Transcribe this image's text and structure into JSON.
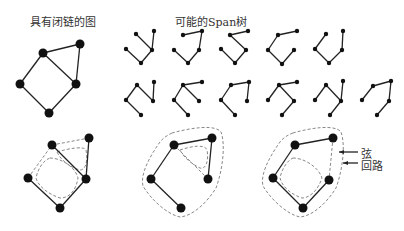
{
  "titles": {
    "graph": "具有闭链的图",
    "spanning_trees": "可能的Span树"
  },
  "annotations": {
    "chord": "弦",
    "loop": "回路"
  },
  "colors": {
    "edge": "#222222",
    "node": "#111111",
    "dashed": "#888888"
  },
  "main_graph": {
    "nodes": [
      [
        43,
        53
      ],
      [
        80,
        44
      ],
      [
        76,
        84
      ],
      [
        20,
        84
      ],
      [
        49,
        113
      ]
    ],
    "edges": [
      [
        0,
        1
      ],
      [
        1,
        2
      ],
      [
        0,
        2
      ],
      [
        2,
        4
      ],
      [
        4,
        3
      ],
      [
        3,
        0
      ]
    ]
  },
  "spanning_trees": [
    {
      "nodes": [
        [
          136,
          34
        ],
        [
          154,
          31
        ],
        [
          152,
          50
        ],
        [
          126,
          49
        ],
        [
          141,
          63
        ]
      ],
      "edges": [
        [
          0,
          2
        ],
        [
          1,
          2
        ],
        [
          2,
          4
        ],
        [
          4,
          3
        ]
      ]
    },
    {
      "nodes": [
        [
          183,
          35
        ],
        [
          202,
          31
        ],
        [
          199,
          50
        ],
        [
          174,
          50
        ],
        [
          188,
          63
        ]
      ],
      "edges": [
        [
          0,
          1
        ],
        [
          1,
          2
        ],
        [
          2,
          4
        ],
        [
          4,
          3
        ]
      ]
    },
    {
      "nodes": [
        [
          230,
          35
        ],
        [
          248,
          31
        ],
        [
          246,
          50
        ],
        [
          221,
          49
        ],
        [
          235,
          63
        ]
      ],
      "edges": [
        [
          0,
          1
        ],
        [
          0,
          2
        ],
        [
          2,
          4
        ],
        [
          4,
          3
        ]
      ]
    },
    {
      "nodes": [
        [
          278,
          35
        ],
        [
          297,
          31
        ],
        [
          294,
          50
        ],
        [
          268,
          50
        ],
        [
          282,
          64
        ]
      ],
      "edges": [
        [
          0,
          1
        ],
        [
          0,
          3
        ],
        [
          3,
          4
        ],
        [
          4,
          2
        ]
      ]
    },
    {
      "nodes": [
        [
          326,
          34
        ],
        [
          343,
          31
        ],
        [
          342,
          50
        ],
        [
          315,
          49
        ],
        [
          329,
          63
        ]
      ],
      "edges": [
        [
          0,
          3
        ],
        [
          3,
          4
        ],
        [
          4,
          2
        ],
        [
          2,
          1
        ]
      ]
    },
    {
      "nodes": [
        [
          137,
          85
        ],
        [
          154,
          82
        ],
        [
          153,
          101
        ],
        [
          126,
          100
        ],
        [
          141,
          115
        ]
      ],
      "edges": [
        [
          0,
          3
        ],
        [
          3,
          4
        ],
        [
          0,
          2
        ],
        [
          2,
          1
        ]
      ]
    },
    {
      "nodes": [
        [
          183,
          85
        ],
        [
          202,
          82
        ],
        [
          199,
          101
        ],
        [
          174,
          100
        ],
        [
          188,
          115
        ]
      ],
      "edges": [
        [
          0,
          1
        ],
        [
          0,
          2
        ],
        [
          0,
          3
        ],
        [
          3,
          4
        ]
      ]
    },
    {
      "nodes": [
        [
          231,
          85
        ],
        [
          249,
          82
        ],
        [
          247,
          101
        ],
        [
          221,
          100
        ],
        [
          235,
          115
        ]
      ],
      "edges": [
        [
          0,
          1
        ],
        [
          1,
          2
        ],
        [
          0,
          3
        ],
        [
          3,
          4
        ]
      ]
    },
    {
      "nodes": [
        [
          279,
          85
        ],
        [
          297,
          82
        ],
        [
          294,
          101
        ],
        [
          268,
          100
        ],
        [
          282,
          115
        ]
      ],
      "edges": [
        [
          0,
          1
        ],
        [
          0,
          3
        ],
        [
          0,
          2
        ],
        [
          2,
          4
        ]
      ]
    },
    {
      "nodes": [
        [
          326,
          85
        ],
        [
          343,
          81
        ],
        [
          341,
          101
        ],
        [
          315,
          100
        ],
        [
          330,
          115
        ]
      ],
      "edges": [
        [
          0,
          3
        ],
        [
          0,
          2
        ],
        [
          2,
          1
        ],
        [
          2,
          4
        ]
      ]
    },
    {
      "nodes": [
        [
          373,
          86
        ],
        [
          391,
          81
        ],
        [
          389,
          101
        ],
        [
          362,
          100
        ],
        [
          377,
          115
        ]
      ],
      "edges": [
        [
          0,
          1
        ],
        [
          1,
          2
        ],
        [
          2,
          4
        ],
        [
          0,
          3
        ]
      ]
    }
  ],
  "loop_examples": [
    {
      "nodes": [
        [
          52,
          145
        ],
        [
          89,
          138
        ],
        [
          86,
          179
        ],
        [
          28,
          178
        ],
        [
          60,
          208
        ]
      ],
      "solid": [
        [
          0,
          2
        ],
        [
          1,
          2
        ],
        [
          2,
          4
        ],
        [
          4,
          3
        ]
      ],
      "chords": [
        [
          0,
          1
        ],
        [
          3,
          0
        ]
      ],
      "loops": [
        "M57,152 C70,148 84,146 86,150 C88,160 86,170 80,170 C72,168 62,162 57,152 Z",
        "M50,158 C60,158 75,166 78,178 C76,190 70,198 60,198 C48,194 38,186 36,178 C38,168 44,160 50,158 Z"
      ]
    },
    {
      "nodes": [
        [
          174,
          145
        ],
        [
          212,
          138
        ],
        [
          208,
          179
        ],
        [
          151,
          179
        ],
        [
          181,
          208
        ]
      ],
      "solid": [
        [
          0,
          1
        ],
        [
          1,
          2
        ],
        [
          0,
          3
        ],
        [
          3,
          4
        ]
      ],
      "chords": [
        [
          0,
          2
        ]
      ],
      "loops": [
        "M180,150 C192,146 205,144 207,150 C209,160 206,170 200,168 C192,164 184,158 180,150 Z",
        "M172,133 C190,128 215,124 221,132 C226,146 222,172 216,188 C206,204 192,216 180,217 C166,214 150,198 143,186 C140,174 150,156 160,142 C164,137 168,135 172,133 Z"
      ]
    },
    {
      "nodes": [
        [
          295,
          145
        ],
        [
          333,
          138
        ],
        [
          329,
          180
        ],
        [
          273,
          178
        ],
        [
          303,
          208
        ]
      ],
      "solid": [
        [
          0,
          1
        ],
        [
          0,
          3
        ],
        [
          3,
          4
        ],
        [
          4,
          2
        ]
      ],
      "chords": [
        [
          1,
          2
        ]
      ],
      "loops": [
        "M293,158 C303,158 318,166 322,178 C318,190 310,198 302,198 C290,194 282,186 280,178 C282,168 288,160 293,158 Z",
        "M293,133 C310,128 335,124 341,132 C346,146 342,172 336,188 C326,204 312,216 300,217 C286,214 270,198 263,186 C260,174 270,156 280,142 C284,137 288,135 293,133 Z"
      ]
    }
  ],
  "arrows": [
    {
      "from": [
        358,
        152
      ],
      "to": [
        339,
        152
      ]
    },
    {
      "from": [
        358,
        163
      ],
      "to": [
        343,
        163
      ]
    }
  ]
}
